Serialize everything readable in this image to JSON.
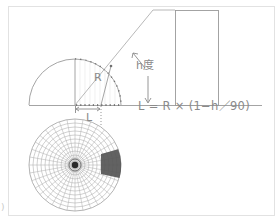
{
  "diagram": {
    "title": "",
    "labels": {
      "radius": "R",
      "elevation_angle": "h度",
      "projected_distance": "L",
      "formula": "L = R × (1−h／90)",
      "corner_mark": ")"
    },
    "elements": [
      {
        "id": "hemisphere",
        "type": "half-circle",
        "description": "Vertical cross-section of sky hemisphere with radius R"
      },
      {
        "id": "sight-line",
        "type": "line",
        "description": "Line from observer at elevation angle h to top of building"
      },
      {
        "id": "building",
        "type": "rectangle",
        "description": "Building/obstacle outline"
      },
      {
        "id": "ground-line",
        "type": "line",
        "description": "Horizontal ground line"
      },
      {
        "id": "fisheye-projection",
        "type": "polar-grid",
        "description": "Equidistant fisheye (polar) projection of hemisphere showing obstruction as shaded sector"
      },
      {
        "id": "obstruction-sector",
        "type": "shaded-sector",
        "description": "Dark sector representing projected building"
      }
    ],
    "colors": {
      "line": "#9a9a9a",
      "grid": "#a8a8a8",
      "shade": "#555555",
      "frame": "#e2e2e2",
      "text": "#8a8a8a"
    }
  }
}
